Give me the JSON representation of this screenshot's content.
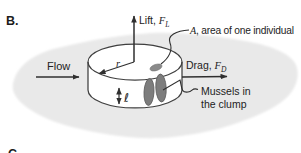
{
  "figure": {
    "panel_label": "B.",
    "next_panel_label": "C.",
    "labels": {
      "lift": {
        "prefix": "Lift, ",
        "symbol": "F",
        "sub": "L"
      },
      "drag": {
        "prefix": "Drag, ",
        "symbol": "F",
        "sub": "D"
      },
      "flow": "Flow",
      "area": {
        "symbol": "A",
        "rest": ", area of one individual"
      },
      "radius_symbol": "r",
      "height_symbol": "ℓ",
      "mussels_line1": "Mussels in",
      "mussels_line2": "the clump"
    },
    "colors": {
      "substrate": "#e9e9e9",
      "cylinder_fill": "#ffffff",
      "outline": "#3f3f3f",
      "arrow": "#2f2f2f",
      "mussel": "#7d7d7d",
      "mussel_edge": "#5a5a5a",
      "individual_area": "#8a8a8a",
      "text": "#232323"
    }
  }
}
